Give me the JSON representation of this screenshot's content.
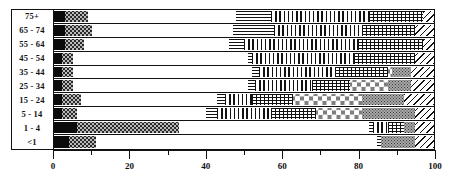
{
  "chart_data": {
    "type": "bar",
    "subtype": "stacked-horizontal-100-percent",
    "title": "",
    "xlabel": "",
    "ylabel": "",
    "xlim": [
      0,
      100
    ],
    "grid": false,
    "legend_position": "none",
    "orientation": "horizontal",
    "stack_total": 100,
    "categories": [
      "75+",
      "65 - 74",
      "55 - 64",
      "45 - 54",
      "35 - 44",
      "25 - 34",
      "15 - 24",
      "5 - 14",
      "1 - 4",
      "<1"
    ],
    "series": [
      {
        "name": "segment-1",
        "pattern": "solid-black",
        "values": [
          3,
          3,
          3,
          2,
          2,
          2,
          2,
          2,
          6,
          4
        ]
      },
      {
        "name": "segment-2",
        "pattern": "gray-dots",
        "values": [
          6,
          7,
          5,
          3,
          3,
          3,
          5,
          4,
          27,
          7
        ]
      },
      {
        "name": "segment-3",
        "pattern": "white",
        "values": [
          39,
          37,
          38,
          46,
          47,
          46,
          36,
          34,
          50,
          74
        ]
      },
      {
        "name": "segment-4",
        "pattern": "horizontal-lines",
        "values": [
          9,
          11,
          4,
          1,
          2,
          2,
          2,
          3,
          1,
          1
        ]
      },
      {
        "name": "segment-5",
        "pattern": "vertical-lines",
        "values": [
          26,
          23,
          30,
          27,
          20,
          15,
          7,
          14,
          4,
          0
        ]
      },
      {
        "name": "segment-6",
        "pattern": "grid-crosshatch",
        "values": [
          14,
          14,
          17,
          16,
          14,
          10,
          11,
          12,
          4,
          0
        ]
      },
      {
        "name": "segment-7",
        "pattern": "white-circles",
        "values": [
          0,
          0,
          0,
          0,
          1,
          10,
          18,
          12,
          0,
          0
        ]
      },
      {
        "name": "segment-8",
        "pattern": "fine-gray-dots",
        "values": [
          0,
          0,
          0,
          0,
          5,
          6,
          11,
          14,
          3,
          9
        ]
      },
      {
        "name": "segment-9",
        "pattern": "diagonal-lines",
        "values": [
          3,
          5,
          3,
          5,
          6,
          6,
          8,
          5,
          5,
          5
        ]
      }
    ],
    "xticks_major": [
      0,
      20,
      40,
      60,
      80,
      100
    ],
    "xticks_minor": [
      10,
      30,
      50,
      70,
      90
    ],
    "xtick_labels": [
      "0",
      "20",
      "40",
      "60",
      "80",
      "100"
    ]
  },
  "axis": {
    "x_labels": [
      "0",
      "20",
      "40",
      "60",
      "80",
      "100"
    ],
    "y_labels": [
      "75+",
      "65 - 74",
      "55 - 64",
      "45 - 54",
      "35 - 44",
      "25 - 34",
      "15 - 24",
      "5 - 14",
      "1 - 4",
      "<1"
    ]
  },
  "colors": {
    "ink": "#111111",
    "solid_fill": "#0b0b0b",
    "dot_fill": "#b9b9b9",
    "circle_fill": "#7e7e7e",
    "fine_dot_fill": "#a8a8a8",
    "background": "#ffffff"
  }
}
